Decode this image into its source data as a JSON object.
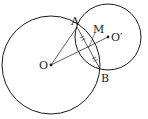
{
  "diagram": {
    "title": "",
    "labels": {
      "A": "A",
      "B": "B",
      "M": "M",
      "O": "O",
      "O_prime": "O′"
    },
    "points": {
      "O": [
        51,
        65
      ],
      "O_prime": [
        108,
        37
      ],
      "A": [
        77,
        27
      ],
      "B": [
        100,
        69
      ],
      "M": [
        88.5,
        48
      ]
    },
    "circles": [
      {
        "name": "circle-O",
        "center": "O",
        "radius": 49
      },
      {
        "name": "circle-O-prime",
        "center": "O_prime",
        "radius": 33
      }
    ],
    "segments": [
      [
        "O",
        "A"
      ],
      [
        "O",
        "O_prime"
      ],
      [
        "A",
        "B"
      ]
    ],
    "tick_marks": "AM = MB (double ticks on each half of chord AB)",
    "stroke_color": "#1a1a1a"
  }
}
